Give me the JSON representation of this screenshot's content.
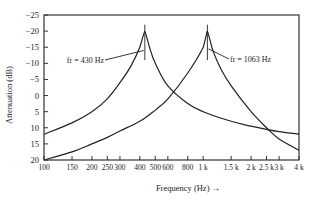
{
  "chart_data": {
    "type": "line",
    "title": "",
    "xlabel": "Frequency (Hz) →",
    "ylabel": "Attenuation (dB)",
    "xscale": "log",
    "xlim": [
      100,
      4000
    ],
    "ylim": [
      20,
      -25
    ],
    "grid": false,
    "x_ticks": [
      100,
      150,
      200,
      250,
      300,
      400,
      500,
      600,
      800,
      1000,
      1500,
      2000,
      2500,
      3000,
      4000
    ],
    "x_tick_labels": [
      "100",
      "150",
      "200",
      "250",
      "300",
      "400",
      "500",
      "600",
      "800",
      "1 k",
      "1.5 k",
      "2 k",
      "2.5 k",
      "3 k",
      "4 k"
    ],
    "y_ticks": [
      -25,
      -20,
      -15,
      -10,
      -5,
      0,
      5,
      10,
      15,
      20
    ],
    "y_tick_labels": [
      "-25",
      "-20",
      "-15",
      "-10",
      "-5",
      "0",
      "5",
      "10",
      "15",
      "20"
    ],
    "series": [
      {
        "name": "fr = 430 Hz",
        "resonance_hz": 430,
        "x": [
          100,
          150,
          200,
          250,
          300,
          350,
          400,
          430,
          460,
          500,
          600,
          800,
          1000,
          1500,
          2000,
          2500,
          3000,
          4000
        ],
        "y": [
          12,
          8.5,
          5,
          1,
          -4,
          -9,
          -15,
          -20,
          -15,
          -10,
          -3,
          2.5,
          5,
          8,
          9.5,
          10.5,
          11.2,
          12
        ]
      },
      {
        "name": "fr = 1063 Hz",
        "resonance_hz": 1063,
        "x": [
          100,
          150,
          200,
          250,
          300,
          400,
          500,
          600,
          800,
          1000,
          1063,
          1150,
          1300,
          1500,
          2000,
          2500,
          3000,
          4000
        ],
        "y": [
          20,
          17.5,
          15,
          13,
          11,
          8,
          4.5,
          1,
          -7,
          -15,
          -20,
          -14,
          -8,
          -3,
          5,
          10,
          13.5,
          17
        ]
      }
    ],
    "annotations": [
      {
        "text": "fr = 430 Hz",
        "x": 430,
        "y": -11
      },
      {
        "text": "fr = 1063 Hz",
        "x": 1063,
        "y": -11
      }
    ]
  },
  "labels": {
    "ylabel": "Attenuation (dB)",
    "xlabel": "Frequency (Hz) →",
    "annot1": "fr = 430 Hz",
    "annot2": "fr = 1063 Hz"
  }
}
